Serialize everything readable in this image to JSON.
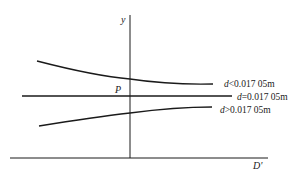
{
  "diagram": {
    "axes": {
      "y_label": "y",
      "x_label": "D'"
    },
    "point_label": "P",
    "curves": [
      {
        "name": "upper",
        "var": "d",
        "relation": "<0.017 05m",
        "label": "d<0.017 05m"
      },
      {
        "name": "middle",
        "var": "d",
        "relation": "=0.017 05m",
        "label": "d=0.017 05m"
      },
      {
        "name": "lower",
        "var": "d",
        "relation": ">0.017 05m",
        "label": "d>0.017 05m"
      }
    ],
    "colors": {
      "line": "#1a1a1a",
      "background": "#ffffff"
    }
  }
}
